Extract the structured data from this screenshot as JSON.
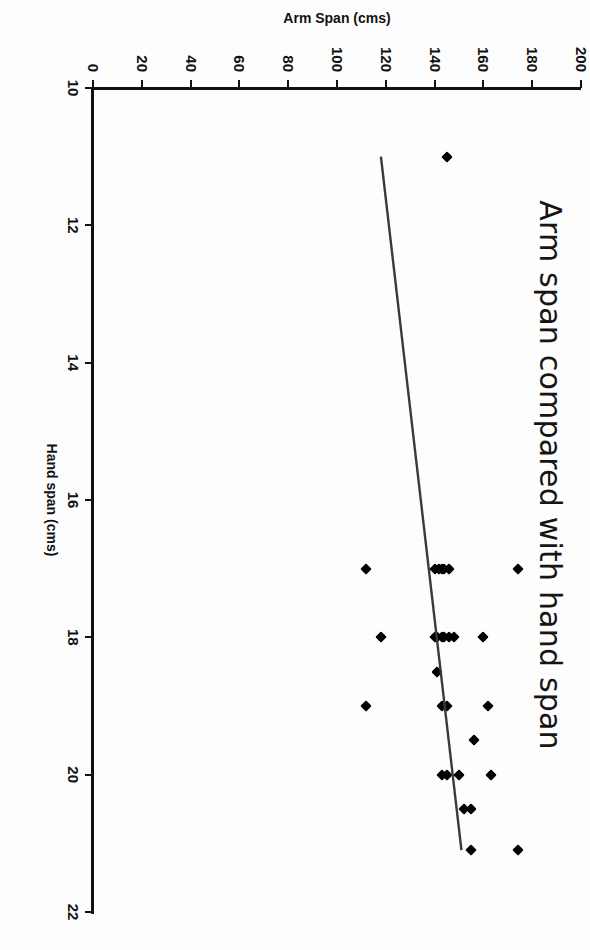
{
  "page": {
    "orientation": "rotated-90-clockwise",
    "background": "#fdfdfd"
  },
  "chart_data": {
    "type": "scatter",
    "title": "Arm span compared with hand span",
    "xlabel": "Hand span (cms)",
    "ylabel": "Arm Span (cms)",
    "xlim": [
      10,
      22
    ],
    "ylim": [
      0,
      200
    ],
    "xticks": [
      10,
      12,
      14,
      16,
      18,
      20,
      22
    ],
    "yticks": [
      0,
      20,
      40,
      60,
      80,
      100,
      120,
      140,
      160,
      180,
      200
    ],
    "grid": false,
    "legend": false,
    "marker": "diamond",
    "marker_color": "#000000",
    "trendline": {
      "label": "linear trendline",
      "color": "#3a3a3a",
      "x_start": 11.0,
      "y_start": 118,
      "x_end": 21.1,
      "y_end": 151
    },
    "points": [
      {
        "x": 11.0,
        "y": 145
      },
      {
        "x": 17.0,
        "y": 174
      },
      {
        "x": 17.0,
        "y": 146
      },
      {
        "x": 17.0,
        "y": 144
      },
      {
        "x": 17.0,
        "y": 143
      },
      {
        "x": 17.0,
        "y": 142
      },
      {
        "x": 17.0,
        "y": 140
      },
      {
        "x": 17.0,
        "y": 112
      },
      {
        "x": 18.0,
        "y": 160
      },
      {
        "x": 18.0,
        "y": 148
      },
      {
        "x": 18.0,
        "y": 146
      },
      {
        "x": 18.0,
        "y": 144
      },
      {
        "x": 18.0,
        "y": 143
      },
      {
        "x": 18.0,
        "y": 141
      },
      {
        "x": 18.0,
        "y": 140
      },
      {
        "x": 18.0,
        "y": 118
      },
      {
        "x": 18.5,
        "y": 141
      },
      {
        "x": 19.0,
        "y": 162
      },
      {
        "x": 19.0,
        "y": 145
      },
      {
        "x": 19.0,
        "y": 143
      },
      {
        "x": 19.0,
        "y": 112
      },
      {
        "x": 19.5,
        "y": 156
      },
      {
        "x": 20.0,
        "y": 163
      },
      {
        "x": 20.0,
        "y": 150
      },
      {
        "x": 20.0,
        "y": 145
      },
      {
        "x": 20.0,
        "y": 143
      },
      {
        "x": 20.5,
        "y": 155
      },
      {
        "x": 20.5,
        "y": 152
      },
      {
        "x": 21.1,
        "y": 174
      },
      {
        "x": 21.1,
        "y": 155
      }
    ]
  }
}
